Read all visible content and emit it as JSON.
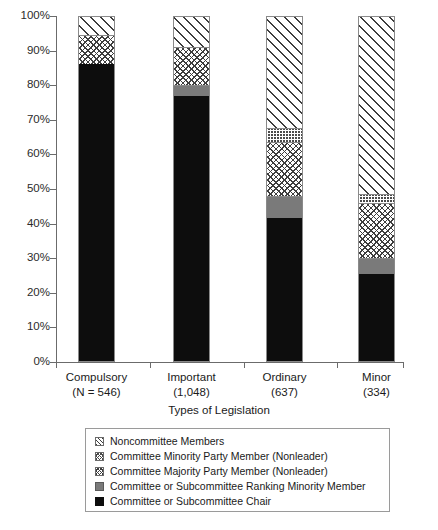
{
  "chart_data": {
    "type": "bar",
    "subtype": "stacked-percentage",
    "title": "",
    "xlabel": "Types of Legislation",
    "ylabel": "",
    "ylim": [
      0,
      100
    ],
    "grid": false,
    "legend_position": "bottom",
    "ytick_labels": [
      "0%",
      "10%",
      "20%",
      "30%",
      "40%",
      "50%",
      "60%",
      "70%",
      "80%",
      "90%",
      "100%"
    ],
    "ytick_values": [
      0,
      10,
      20,
      30,
      40,
      50,
      60,
      70,
      80,
      90,
      100
    ],
    "categories": [
      "Compulsory",
      "Important",
      "Ordinary",
      "Minor"
    ],
    "category_sublabels": [
      "(N = 546)",
      "(1,048)",
      "(637)",
      "(334)"
    ],
    "category_n": [
      546,
      1048,
      637,
      334
    ],
    "series": [
      {
        "name": "Committee or Subcommittee Chair",
        "key": "chair",
        "values": [
          86.0,
          77.0,
          41.5,
          25.5
        ]
      },
      {
        "name": "Committee or Subcommittee Ranking Minority Member",
        "key": "ranking",
        "values": [
          0.0,
          3.0,
          6.5,
          4.5
        ]
      },
      {
        "name": "Committee Majority Party Member (Nonleader)",
        "key": "majority",
        "values": [
          8.5,
          11.0,
          15.5,
          16.0
        ]
      },
      {
        "name": "Committee Minority Party Member (Nonleader)",
        "key": "minority",
        "values": [
          0.0,
          0.0,
          4.0,
          2.5
        ]
      },
      {
        "name": "Noncommittee Members",
        "key": "noncommittee",
        "values": [
          5.5,
          9.0,
          32.5,
          51.5
        ]
      }
    ]
  },
  "legend": {
    "items": [
      {
        "label": "Noncommittee Members",
        "swatch": "diagonal-hatch-swatch"
      },
      {
        "label": "Committee Minority Party Member (Nonleader)",
        "swatch": "fine-grid-swatch"
      },
      {
        "label": "Committee Majority Party Member (Nonleader)",
        "swatch": "cross-grid-swatch"
      },
      {
        "label": "Committee or Subcommittee Ranking Minority Member",
        "swatch": "gray-solid-swatch"
      },
      {
        "label": "Committee or Subcommittee Chair",
        "swatch": "black-solid-swatch"
      }
    ]
  },
  "colors": {
    "chair": "#0d0d0d",
    "ranking": "#7a7a7a",
    "hatch_line": "#3d3d3d",
    "axis": "#6b6b6b",
    "background": "#ffffff"
  }
}
